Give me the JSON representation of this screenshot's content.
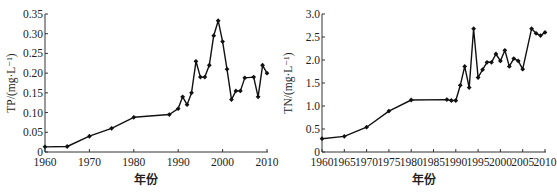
{
  "chart_data": [
    {
      "type": "line",
      "title": "",
      "xlabel": "年份",
      "ylabel": "TP/(mg·L⁻¹)",
      "xlim": [
        1960,
        2010
      ],
      "ylim": [
        0,
        0.35
      ],
      "grid": false,
      "legend": null,
      "x_ticks": [
        1960,
        1970,
        1980,
        1990,
        2000,
        2010
      ],
      "y_ticks": [
        0,
        0.05,
        0.1,
        0.15,
        0.2,
        0.25,
        0.3,
        0.35
      ],
      "y_tick_labels": [
        "0",
        "0.05",
        "0.10",
        "0.15",
        "0.20",
        "0.25",
        "0.30",
        "0.35"
      ],
      "x": [
        1960,
        1965,
        1970,
        1975,
        1980,
        1988,
        1990,
        1991,
        1992,
        1993,
        1994,
        1995,
        1996,
        1997,
        1998,
        1999,
        2000,
        2001,
        2002,
        2003,
        2004,
        2005,
        2007,
        2008,
        2009,
        2010
      ],
      "series": [
        {
          "name": "TP",
          "values": [
            0.013,
            0.014,
            0.04,
            0.06,
            0.088,
            0.095,
            0.11,
            0.14,
            0.12,
            0.15,
            0.23,
            0.19,
            0.19,
            0.22,
            0.295,
            0.333,
            0.28,
            0.21,
            0.133,
            0.155,
            0.155,
            0.188,
            0.19,
            0.14,
            0.22,
            0.2
          ]
        }
      ]
    },
    {
      "type": "line",
      "title": "",
      "xlabel": "年份",
      "ylabel": "TN/(mg·L⁻¹)",
      "xlim": [
        1960,
        2010
      ],
      "ylim": [
        0,
        3.0
      ],
      "grid": false,
      "legend": null,
      "x_ticks": [
        1960,
        1965,
        1970,
        1975,
        1980,
        1985,
        1990,
        1995,
        2000,
        2005,
        2010
      ],
      "y_ticks": [
        0,
        0.5,
        1.0,
        1.5,
        2.0,
        2.5,
        3.0
      ],
      "y_tick_labels": [
        "0",
        "0.5",
        "1.0",
        "1.5",
        "2.0",
        "2.5",
        "3.0"
      ],
      "x": [
        1960,
        1965,
        1970,
        1975,
        1980,
        1988,
        1989,
        1990,
        1991,
        1992,
        1993,
        1994,
        1995,
        1996,
        1997,
        1998,
        1999,
        2000,
        2001,
        2002,
        2003,
        2004,
        2005,
        2007,
        2008,
        2009,
        2010
      ],
      "series": [
        {
          "name": "TN",
          "values": [
            0.29,
            0.34,
            0.54,
            0.89,
            1.13,
            1.14,
            1.12,
            1.12,
            1.45,
            1.86,
            1.4,
            2.68,
            1.62,
            1.79,
            1.95,
            1.95,
            2.13,
            1.98,
            2.21,
            1.86,
            2.03,
            1.98,
            1.8,
            2.68,
            2.58,
            2.53,
            2.6
          ]
        }
      ]
    }
  ],
  "layout": {
    "panels": [
      {
        "x0": 45,
        "x1": 267,
        "y0": 152,
        "y1": 14
      },
      {
        "x0": 322,
        "x1": 545,
        "y0": 152,
        "y1": 14
      }
    ],
    "line_color": "#111111"
  }
}
